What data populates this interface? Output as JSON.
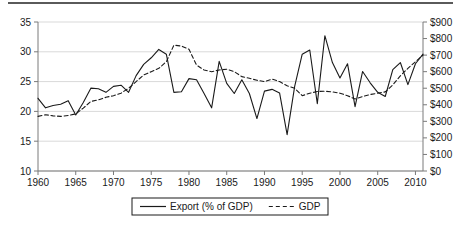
{
  "figure": {
    "has_top_rule": true,
    "background_color": "#ffffff",
    "line_color": "#1a1a1a",
    "gridline_color": "#d9d9d9",
    "axis_color": "#7a7a7a"
  },
  "legend": {
    "position": "bottom-center",
    "boxed": true,
    "entries": [
      {
        "label": "Export (% of GDP)",
        "style": "solid"
      },
      {
        "label": "GDP",
        "style": "dashed"
      }
    ]
  },
  "chart_data": {
    "type": "line",
    "title": "",
    "subtitle": "",
    "xlabel": "",
    "ylabel": "",
    "grid": true,
    "legend_position": "bottom",
    "x": [
      1960,
      1961,
      1962,
      1963,
      1964,
      1965,
      1966,
      1967,
      1968,
      1969,
      1970,
      1971,
      1972,
      1973,
      1974,
      1975,
      1976,
      1977,
      1978,
      1979,
      1980,
      1981,
      1982,
      1983,
      1984,
      1985,
      1986,
      1987,
      1988,
      1989,
      1990,
      1991,
      1992,
      1993,
      1994,
      1995,
      1996,
      1997,
      1998,
      1999,
      2000,
      2001,
      2002,
      2003,
      2004,
      2005,
      2006,
      2007,
      2008,
      2009,
      2010,
      2011
    ],
    "xlim": [
      1960,
      2011
    ],
    "xticks": [
      1960,
      1965,
      1970,
      1975,
      1980,
      1985,
      1990,
      1995,
      2000,
      2005,
      2010
    ],
    "xticklabels": [
      "1960",
      "1965",
      "1970",
      "1975",
      "1980",
      "1985",
      "1990",
      "1995",
      "2000",
      "2005",
      "2010"
    ],
    "axes": [
      {
        "id": "left",
        "side": "left",
        "ylim": [
          10,
          35
        ],
        "yticks": [
          10,
          15,
          20,
          25,
          30,
          35
        ],
        "yticklabels": [
          "10",
          "15",
          "20",
          "25",
          "30",
          "35"
        ],
        "series_id": "export"
      },
      {
        "id": "right",
        "side": "right",
        "ylim": [
          0,
          900
        ],
        "yticks": [
          0,
          100,
          200,
          300,
          400,
          500,
          600,
          700,
          800,
          900
        ],
        "yticklabels": [
          "$0",
          "$100",
          "$200",
          "$300",
          "$400",
          "$500",
          "$600",
          "$700",
          "$800",
          "$900"
        ],
        "series_id": "gdp"
      }
    ],
    "series": [
      {
        "id": "export",
        "name": "Export (% of GDP)",
        "axis": "left",
        "style": "solid",
        "color": "#1a1a1a",
        "unit": "% of GDP",
        "values": [
          22.2,
          20.6,
          21.0,
          21.2,
          21.8,
          19.4,
          21.5,
          23.9,
          23.8,
          23.2,
          24.2,
          24.4,
          23.2,
          26.0,
          27.9,
          29.0,
          30.4,
          29.6,
          23.2,
          23.3,
          25.5,
          25.3,
          23.0,
          20.6,
          28.4,
          24.7,
          23.0,
          25.3,
          23.0,
          18.8,
          23.4,
          23.7,
          23.1,
          16.1,
          24.2,
          29.6,
          30.3,
          21.3,
          32.7,
          28.2,
          25.6,
          28.0,
          20.8,
          26.7,
          24.8,
          23.2,
          22.5,
          27.0,
          28.2,
          24.5,
          28.0,
          29.6
        ]
      },
      {
        "id": "gdp",
        "name": "GDP",
        "axis": "right",
        "style": "dashed",
        "color": "#1a1a1a",
        "unit": "$",
        "values": [
          330,
          340,
          333,
          330,
          335,
          345,
          380,
          420,
          430,
          445,
          455,
          470,
          500,
          540,
          580,
          600,
          620,
          660,
          760,
          755,
          735,
          640,
          610,
          600,
          610,
          615,
          600,
          570,
          560,
          548,
          540,
          555,
          540,
          515,
          500,
          455,
          470,
          480,
          482,
          478,
          470,
          455,
          435,
          450,
          462,
          470,
          478,
          520,
          575,
          620,
          660,
          700
        ]
      }
    ]
  }
}
